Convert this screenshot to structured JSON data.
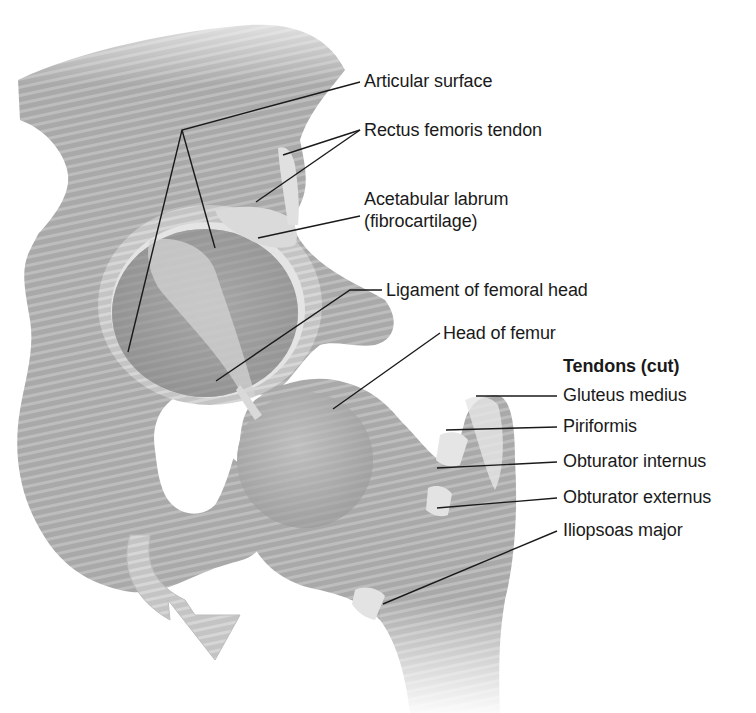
{
  "diagram": {
    "colors": {
      "background": "#ffffff",
      "bone": "#a8a8a8",
      "bone_dark": "#8c8c8c",
      "bone_light": "#cfcfcf",
      "cartilage": "#e2e2e2",
      "leader_line": "#1a1a1a",
      "text": "#1a1a1a"
    },
    "labels": {
      "articular_surface": "Articular surface",
      "rectus_femoris_tendon": "Rectus femoris tendon",
      "acetabular_labrum_1": "Acetabular labrum",
      "acetabular_labrum_2": "(fibrocartilage)",
      "ligament_femoral_head": "Ligament of femoral head",
      "head_of_femur": "Head of femur",
      "tendons_heading": "Tendons (cut)",
      "gluteus_medius": "Gluteus medius",
      "piriformis": "Piriformis",
      "obturator_internus": "Obturator internus",
      "obturator_externus": "Obturator externus",
      "iliopsoas_major": "Iliopsoas major"
    }
  }
}
